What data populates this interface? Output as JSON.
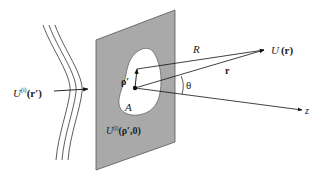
{
  "diagram": {
    "type": "aperture-diffraction-geometry",
    "colors": {
      "background": "#ffffff",
      "screen_fill": "#a9a9a9",
      "screen_edge": "#555555",
      "aperture_fill": "#ffffff",
      "line": "#222222"
    },
    "labels": {
      "incident_field": {
        "main": "U",
        "sup": "(i)",
        "arg": "(r′)"
      },
      "aperture_field": {
        "main": "U",
        "sup": "(i)",
        "arg": "(ρ′,0)"
      },
      "aperture_name": "A",
      "rho_prime": "ρ′",
      "distance_R": "R",
      "position_r": "r",
      "observed_field": {
        "main": "U",
        "arg": "(r)"
      },
      "angle": "θ",
      "axis": "z"
    },
    "elements": [
      "incident-wavefronts",
      "opaque-screen",
      "aperture-A",
      "vector-rho-prime",
      "vector-R",
      "vector-r",
      "z-axis",
      "angle-theta"
    ]
  }
}
